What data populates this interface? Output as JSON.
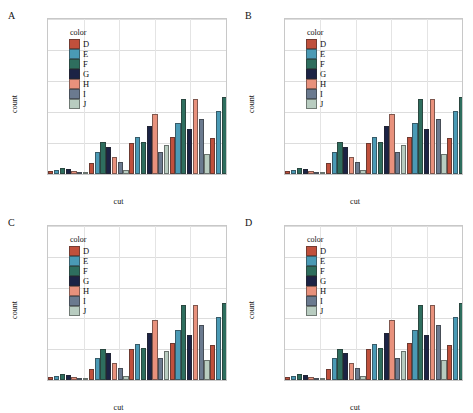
{
  "figure": {
    "panel_labels": [
      "A",
      "B",
      "C",
      "D"
    ]
  },
  "legend": {
    "title": "color",
    "entries": [
      {
        "label": "D",
        "color": "#c0503c"
      },
      {
        "label": "E",
        "color": "#4a9ab5"
      },
      {
        "label": "F",
        "color": "#2e6e5e"
      },
      {
        "label": "G",
        "color": "#1c2345"
      },
      {
        "label": "H",
        "color": "#e8917c"
      },
      {
        "label": "I",
        "color": "#6b7a8f"
      },
      {
        "label": "J",
        "color": "#b8ccc0"
      }
    ]
  },
  "axis": {
    "ylabel": "count",
    "xlabel": "cut",
    "yticks": [
      "0e+00",
      "1e+05",
      "2e+05",
      "3e+05",
      "4e+05",
      "5e+05"
    ],
    "ytick_values": [
      0,
      100000,
      200000,
      300000,
      400000,
      500000
    ],
    "ymin": 0,
    "ymax": 500000
  },
  "chart_data": {
    "type": "bar",
    "title": "",
    "xlabel": "cut",
    "ylabel": "count",
    "ylim": [
      0,
      500000
    ],
    "grid": true,
    "legend_position": "inside-top-left",
    "legend_title": "color",
    "categories": [
      "Fair",
      "Good",
      "Very Good",
      "Premium",
      "Ideal"
    ],
    "series": [
      {
        "name": "D",
        "color": "#c0503c",
        "values": [
          10000,
          35000,
          101000,
          120000,
          115000
        ]
      },
      {
        "name": "E",
        "color": "#4a9ab5",
        "values": [
          13000,
          72000,
          118000,
          163000,
          203000
        ]
      },
      {
        "name": "F",
        "color": "#2e6e5e",
        "values": [
          18000,
          102000,
          103000,
          242000,
          250000
        ]
      },
      {
        "name": "G",
        "color": "#1c2345",
        "values": [
          15000,
          87000,
          154000,
          145000,
          468000
        ]
      },
      {
        "name": "H",
        "color": "#e8917c",
        "values": [
          9000,
          56000,
          194000,
          243000,
          220000
        ]
      },
      {
        "name": "I",
        "color": "#6b7a8f",
        "values": [
          7000,
          38000,
          70000,
          178000,
          130000
        ]
      },
      {
        "name": "J",
        "color": "#b8ccc0",
        "values": [
          6000,
          13000,
          94000,
          64000,
          88000
        ]
      }
    ],
    "panels": [
      {
        "label": "A"
      },
      {
        "label": "B"
      },
      {
        "label": "C"
      },
      {
        "label": "D"
      }
    ]
  }
}
